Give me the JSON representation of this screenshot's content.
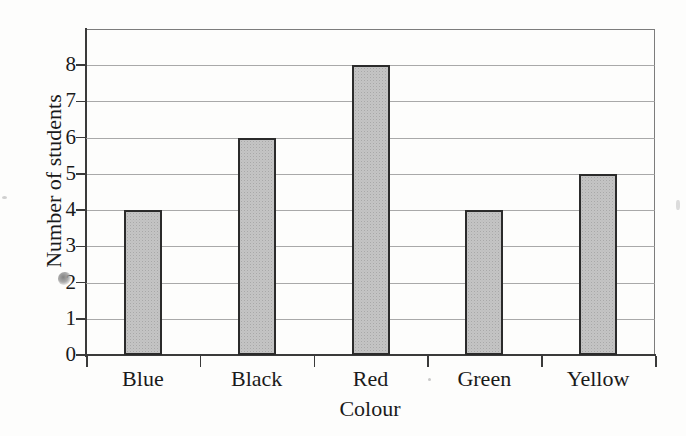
{
  "chart_data": {
    "type": "bar",
    "title": "",
    "subtitle": "",
    "xlabel": "Colour",
    "ylabel": "Number of students",
    "categories": [
      "Blue",
      "Black",
      "Red",
      "Green",
      "Yellow"
    ],
    "values": [
      4,
      6,
      8,
      4,
      5
    ],
    "series": [
      {
        "name": "Number of students",
        "values": [
          4,
          6,
          8,
          4,
          5
        ]
      }
    ],
    "ylim": [
      0,
      9
    ],
    "xlim_categories": 5,
    "ytick_labels": [
      "0",
      "1",
      "2",
      "3",
      "4",
      "5",
      "6",
      "7",
      "8"
    ],
    "ytick_values": [
      0,
      1,
      2,
      3,
      4,
      5,
      6,
      7,
      8
    ],
    "ytick_interval": 1,
    "grid": {
      "horizontal": true,
      "vertical": false
    },
    "legend": {
      "visible": false,
      "position": "none"
    },
    "bar_style": {
      "fill": "#c4c4c4",
      "fill_pattern": "stippled-dots",
      "border": "#2b2b2b"
    },
    "axis_color": "#3a3a3a",
    "gridline_color": "#9a9a9a",
    "background": "#fdfdfc",
    "annotations": [],
    "artifacts": [
      {
        "name": "scan-smudge",
        "description": "dark ink smudge overlapping the 2 tick label"
      }
    ]
  }
}
